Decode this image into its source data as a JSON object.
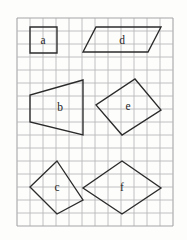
{
  "figure": {
    "background_color": "#fdfdfc",
    "grid": {
      "line_color": "#b9b9bb",
      "origin_x": 17,
      "origin_y": 18,
      "cell_size": 13,
      "columns": 12,
      "rows": 16
    },
    "shape_stroke_color": "#2b2b2b",
    "label_color": "#1e1e1e"
  },
  "shapes": [
    {
      "id": "shape-a",
      "label": "a",
      "kind": "square",
      "points": "30,27 57,27 57,53 30,53",
      "label_x": 43,
      "label_y": 41
    },
    {
      "id": "shape-d",
      "label": "d",
      "kind": "parallelogram",
      "points": "96,27 161,27 148,52 83,52",
      "label_x": 122,
      "label_y": 41
    },
    {
      "id": "shape-b",
      "label": "b",
      "kind": "trapezoid",
      "points": "83,80 83,135 30,122 30,95",
      "label_x": 60,
      "label_y": 108
    },
    {
      "id": "shape-e",
      "label": "e",
      "kind": "rectangle",
      "points": "135,79 161,110 122,135 96,105",
      "label_x": 128,
      "label_y": 107
    },
    {
      "id": "shape-c",
      "label": "c",
      "kind": "kite",
      "points": "57,161 83,200 57,214 30,187",
      "label_x": 57,
      "label_y": 188
    },
    {
      "id": "shape-f",
      "label": "f",
      "kind": "rhombus",
      "points": "122,161 161,188 122,214 83,188",
      "label_x": 122,
      "label_y": 188
    }
  ]
}
